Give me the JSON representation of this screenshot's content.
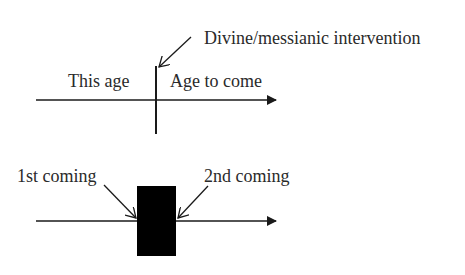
{
  "diagram": {
    "top": {
      "left_label": "This age",
      "right_label": "Age to come",
      "event_label": "Divine/messianic intervention"
    },
    "bottom": {
      "left_label": "1st coming",
      "right_label": "2nd coming"
    },
    "colors": {
      "line": "#1a1a1a",
      "text": "#2a2a2a",
      "block": "#000000",
      "background": "#ffffff"
    }
  }
}
